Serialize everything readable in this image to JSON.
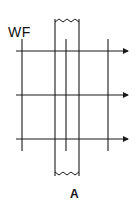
{
  "diagram": {
    "title_label": "WF",
    "strip_label": "A",
    "colors": {
      "line": "#1a1a1a",
      "background": "#ffffff"
    },
    "horizontal_arrows": [
      {
        "y": 51,
        "x1": 16,
        "x2": 128
      },
      {
        "y": 95,
        "x1": 16,
        "x2": 128
      },
      {
        "y": 139,
        "x1": 16,
        "x2": 128
      }
    ],
    "vertical_lines": [
      {
        "x": 22,
        "y1": 39,
        "y2": 151
      },
      {
        "x": 66,
        "y1": 39,
        "y2": 151
      },
      {
        "x": 108,
        "y1": 39,
        "y2": 151
      }
    ],
    "strip": {
      "x_left": 55,
      "x_right": 79,
      "top": 19,
      "bottom": 176
    }
  }
}
